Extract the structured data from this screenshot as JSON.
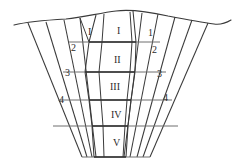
{
  "figure": {
    "kind": "trench-cross-section-diagram",
    "line_color": "#3a3a3a",
    "text_color": "#2b2b2b",
    "background_color": "#ffffff"
  },
  "ground_surface": {
    "name": "ground-surface-line"
  },
  "left_strata": [
    {
      "label": "2",
      "x": 71,
      "y": 43
    },
    {
      "label": "3",
      "x": 65,
      "y": 68
    },
    {
      "label": "4",
      "x": 59,
      "y": 95
    }
  ],
  "right_strata": [
    {
      "label": "1",
      "x": 148,
      "y": 28
    },
    {
      "label": "2",
      "x": 152,
      "y": 45
    },
    {
      "label": "3",
      "x": 157,
      "y": 69
    },
    {
      "label": "4",
      "x": 163,
      "y": 93
    }
  ],
  "upper_left_layer": {
    "label": "I",
    "x": 88,
    "y": 27
  },
  "center_layers": [
    {
      "label": "I",
      "x": 117,
      "y": 26
    },
    {
      "label": "II",
      "x": 114,
      "y": 55
    },
    {
      "label": "III",
      "x": 112,
      "y": 82
    },
    {
      "label": "IV",
      "x": 112,
      "y": 110
    },
    {
      "label": "V",
      "x": 113,
      "y": 138
    }
  ]
}
